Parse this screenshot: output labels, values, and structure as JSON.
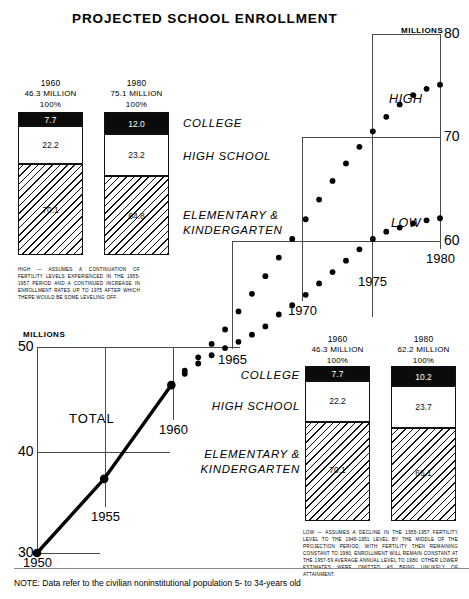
{
  "title": "PROJECTED SCHOOL  ENROLLMENT",
  "note": "NOTE: Data refer to the civilian noninstitutional population 5- to 34-years old",
  "axis_units_top": "MILLIONS",
  "axis_units_bottom": "MILLIONS",
  "series_labels": {
    "high": "HIGH",
    "low": "LOW",
    "total": "TOTAL"
  },
  "y_ticks_top": [
    "80",
    "70",
    "60"
  ],
  "y_ticks_bottom": [
    "50",
    "40",
    "30"
  ],
  "x_ticks": [
    "1950",
    "1955",
    "1960",
    "1965",
    "1970",
    "1975",
    "1980"
  ],
  "categories": {
    "college": "COLLEGE",
    "high_school": "HIGH  SCHOOL",
    "elementary_line1": "ELEMENTARY  &",
    "elementary_line2": "KINDERGARTEN"
  },
  "bars_high": {
    "caption": "HIGH — ASSUMES A CONTINUATION OF FERTILITY LEVELS EXPERIENCED IN THE 1955-1957 PERIOD AND A CONTINUED INCREASE IN ENROLLMENT RATES UP TO 1975 AFTER WHICH THERE WOULD BE SOME LEVELING OFF.",
    "items": [
      {
        "year": "1960",
        "total": "46.3  MILLION",
        "pct": "100%",
        "college": "7.7",
        "high_school": "22.2",
        "elementary": "70.1"
      },
      {
        "year": "1980",
        "total": "75.1  MILLION",
        "pct": "100%",
        "college": "12.0",
        "high_school": "23.2",
        "elementary": "64.8"
      }
    ]
  },
  "bars_low": {
    "caption": "LOW — ASSUMES A DECLINE IN THE 1955-1957 FERTILITY LEVEL TO THE 1949-1951 LEVEL BY THE MIDDLE OF THE PROJECTION PERIOD, WITH FERTILITY THEN REMAINING CONSTANT TO 1980. ENROLLMENT WILL REMAIN CONSTANT AT THE 1957-59 AVERAGE ANNUAL LEVEL TO 1980. OTHER LOWER ESTIMATES WERE OMITTED AS BEING UNLIKELY OF ATTAINMENT.",
    "items": [
      {
        "year": "1960",
        "total": "46.3  MILLION",
        "pct": "100%",
        "college": "7.7",
        "high_school": "22.2",
        "elementary": "70.1"
      },
      {
        "year": "1980",
        "total": "62.2  MILLION",
        "pct": "100%",
        "college": "10.2",
        "high_school": "23.7",
        "elementary": "66.1"
      }
    ]
  },
  "chart_data": {
    "type": "line",
    "title": "PROJECTED SCHOOL ENROLLMENT",
    "xlabel": "",
    "ylabel": "MILLIONS",
    "xlim": [
      1950,
      1981
    ],
    "ylim": [
      30,
      80
    ],
    "grid": true,
    "legend_position": "inline-annotation",
    "x": [
      1950,
      1951,
      1952,
      1953,
      1954,
      1955,
      1956,
      1957,
      1958,
      1959,
      1960,
      1961,
      1962,
      1963,
      1964,
      1965,
      1966,
      1967,
      1968,
      1969,
      1970,
      1971,
      1972,
      1973,
      1974,
      1975,
      1976,
      1977,
      1978,
      1979,
      1980
    ],
    "series": [
      {
        "name": "TOTAL",
        "style": "solid-line-with-markers",
        "x": [
          1950,
          1955,
          1960
        ],
        "values": [
          30.0,
          37.2,
          46.3
        ]
      },
      {
        "name": "HIGH",
        "style": "dotted",
        "x": [
          1960,
          1961,
          1962,
          1963,
          1964,
          1965,
          1966,
          1967,
          1968,
          1969,
          1970,
          1971,
          1972,
          1973,
          1974,
          1975,
          1976,
          1977,
          1978,
          1979,
          1980
        ],
        "values": [
          46.3,
          47.7,
          49.0,
          50.3,
          51.7,
          53.2,
          54.9,
          56.6,
          58.4,
          60.2,
          62.1,
          64.0,
          65.8,
          67.5,
          69.1,
          70.6,
          72.0,
          73.2,
          74.1,
          74.7,
          75.1
        ]
      },
      {
        "name": "LOW",
        "style": "dotted",
        "x": [
          1960,
          1961,
          1962,
          1963,
          1964,
          1965,
          1966,
          1967,
          1968,
          1969,
          1970,
          1971,
          1972,
          1973,
          1974,
          1975,
          1976,
          1977,
          1978,
          1979,
          1980
        ],
        "values": [
          46.3,
          47.4,
          48.4,
          49.2,
          49.9,
          50.5,
          51.2,
          52.0,
          52.9,
          53.8,
          54.8,
          55.9,
          57.0,
          58.1,
          59.2,
          60.2,
          60.9,
          61.3,
          61.7,
          62.0,
          62.2
        ]
      }
    ],
    "annotations": [
      {
        "text": "HIGH",
        "x": 1976,
        "y": 76.5
      },
      {
        "text": "LOW",
        "x": 1976,
        "y": 62.5
      },
      {
        "text": "TOTAL",
        "x": 1953.3,
        "y": 42.5
      }
    ]
  }
}
